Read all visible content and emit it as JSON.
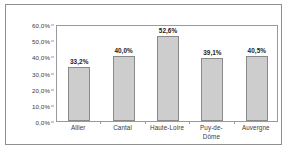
{
  "chart_data": {
    "type": "bar",
    "title": "",
    "subtitle": "",
    "xlabel": "",
    "ylabel": "",
    "categories": [
      "Allier",
      "Cantal",
      "Haute-Loire",
      "Puy-de-Dôme",
      "Auvergne"
    ],
    "category_lines": [
      [
        "Allier"
      ],
      [
        "Cantal"
      ],
      [
        "Haute-Loire"
      ],
      [
        "Puy-de-",
        "Dôme"
      ],
      [
        "Auvergne"
      ]
    ],
    "values": [
      33.2,
      40.0,
      52.6,
      39.1,
      40.5
    ],
    "value_labels": [
      "33,2%",
      "40,0%",
      "52,6%",
      "39,1%",
      "40,5%"
    ],
    "ylim": [
      0,
      60
    ],
    "ytick_values": [
      60,
      50,
      40,
      30,
      20,
      10,
      0
    ],
    "ytick_labels": [
      "60,0%",
      "50,0%",
      "40,0%",
      "30,0%",
      "20,0%",
      "10,0%",
      "0,0%"
    ],
    "grid": false,
    "legend": null,
    "legend_position": "none",
    "bar_fill_color": "#cdcdcd",
    "bar_border_color": "#8a8a8a",
    "axis_color": "#9a9a9a",
    "text_color": "#3a3a3a",
    "value_label_color": "#1b1b1b",
    "background_color": "#ffffff",
    "frame_color": "#8f8f8f"
  }
}
